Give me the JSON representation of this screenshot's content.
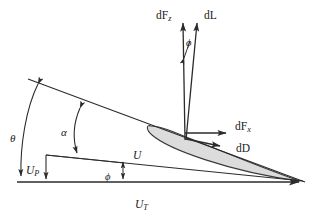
{
  "figure": {
    "name": "blade-element-velocity-and-force-diagram",
    "background_color": "#ffffff",
    "line_color": "#2b2b2b",
    "airfoil_fill": "#dcdcdc",
    "airfoil_stroke": "#3a3a3a",
    "text_color": "#1a1a1a"
  },
  "labels": {
    "dFz": {
      "text": "dF",
      "sub": "z",
      "x": 156,
      "y": 16
    },
    "dL": {
      "text": "dL",
      "x": 204,
      "y": 16
    },
    "phi_top": {
      "text": "ϕ",
      "x": 186,
      "y": 44
    },
    "dFx": {
      "text": "dF",
      "sub": "x",
      "x": 236,
      "y": 130
    },
    "dD": {
      "text": "dD",
      "x": 236,
      "y": 150
    },
    "theta": {
      "text": "θ",
      "x": 11,
      "y": 139
    },
    "alpha": {
      "text": "α",
      "x": 63,
      "y": 134
    },
    "UP": {
      "text": "U",
      "sub": "P",
      "x": 27,
      "y": 172
    },
    "U": {
      "text": "U",
      "x": 134,
      "y": 157
    },
    "phi_bottom": {
      "text": "ϕ",
      "x": 107,
      "y": 178
    },
    "UT": {
      "text": "U",
      "sub": "T",
      "x": 136,
      "y": 206
    }
  },
  "geometry": {
    "apex": {
      "x": 305,
      "y": 182
    },
    "chord_line_start": {
      "x": 28,
      "y": 79
    },
    "baseline_start": {
      "x": 17,
      "y": 182
    },
    "u_line_start": {
      "x": 46,
      "y": 155
    },
    "force_origin": {
      "x": 185,
      "y": 140
    },
    "dFz_tip": {
      "x": 183,
      "y": 22
    },
    "dL_tip": {
      "x": 197,
      "y": 22
    },
    "dFx_tip": {
      "x": 228,
      "y": 133
    },
    "dD_tip": {
      "x": 222,
      "y": 147
    }
  },
  "angle_markers": [
    {
      "name": "theta",
      "symbol": "θ",
      "description": "pitch angle between rotor plane and chord line"
    },
    {
      "name": "alpha",
      "symbol": "α",
      "description": "angle of attack between relative wind and chord line"
    },
    {
      "name": "phi-inflow",
      "symbol": "ϕ",
      "description": "inflow angle between rotor plane and relative velocity U"
    },
    {
      "name": "phi-force",
      "symbol": "ϕ",
      "description": "angle between lift dL and axial force dFz"
    }
  ]
}
